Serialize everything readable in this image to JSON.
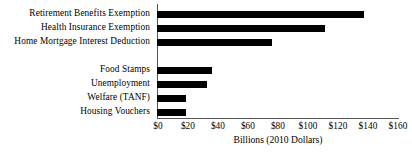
{
  "chart_data": {
    "type": "bar",
    "orientation": "horizontal",
    "title": "",
    "xlabel": "Billions (2010 Dollars)",
    "ylabel": "",
    "xlim": [
      0,
      160
    ],
    "xticks": [
      "$0",
      "$20",
      "$40",
      "$60",
      "$80",
      "$100",
      "$120",
      "$140",
      "$160"
    ],
    "xtick_values": [
      0,
      20,
      40,
      60,
      80,
      100,
      120,
      140,
      160
    ],
    "grid": false,
    "legend": false,
    "bar_color": "#000000",
    "axis_color": "#555555",
    "categories": [
      "Retirement Benefits Exemption",
      "Health Insurance Exemption",
      "Home Mortgage Interest Deduction",
      "",
      "Food Stamps",
      "Unemployment",
      "Welfare (TANF)",
      "Housing Vouchers"
    ],
    "values": [
      137,
      111,
      76,
      null,
      36,
      33,
      19,
      19
    ],
    "bars": [
      {
        "label": "Retirement Benefits Exemption",
        "value": 137
      },
      {
        "label": "Health Insurance Exemption",
        "value": 111
      },
      {
        "label": "Home Mortgage Interest Deduction",
        "value": 76
      },
      {
        "label": "",
        "value": null
      },
      {
        "label": "Food Stamps",
        "value": 36
      },
      {
        "label": "Unemployment",
        "value": 33
      },
      {
        "label": "Welfare (TANF)",
        "value": 19
      },
      {
        "label": "Housing Vouchers",
        "value": 19
      }
    ]
  }
}
